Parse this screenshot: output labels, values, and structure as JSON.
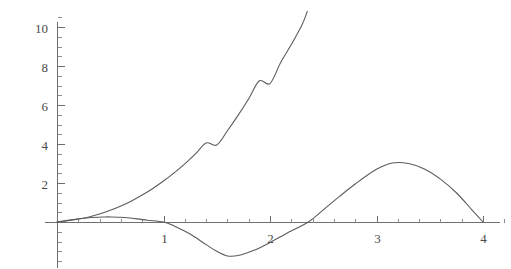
{
  "chart_data": {
    "type": "line",
    "title": "",
    "subtitle": "",
    "xlabel": "",
    "ylabel": "",
    "xlim": [
      -0.12,
      4.26
    ],
    "ylim": [
      -2.3,
      10.9
    ],
    "grid": false,
    "legend": "none",
    "background_color": "#ffffff",
    "axis_color": "#6f6f6f",
    "curve_color": "#5c5c5c",
    "x_ticks_major": [
      1,
      2,
      3,
      4
    ],
    "x_tick_labels": [
      "1",
      "2",
      "3",
      "4"
    ],
    "x_ticks_minor": [
      0.2,
      0.4,
      0.6,
      0.8,
      1.2,
      1.4,
      1.6,
      1.8,
      2.2,
      2.4,
      2.6,
      2.8,
      3.2,
      3.4,
      3.6,
      3.8,
      4.2
    ],
    "y_ticks_major": [
      2,
      4,
      6,
      8,
      10
    ],
    "y_tick_labels": [
      "2",
      "4",
      "6",
      "8",
      "10"
    ],
    "y_ticks_minor": [
      -2,
      -1.5,
      -1,
      -0.5,
      0.5,
      1,
      1.5,
      2.5,
      3,
      3.5,
      4.5,
      5,
      5.5,
      6.5,
      7,
      7.5,
      8.5,
      9,
      9.5,
      10.5
    ],
    "series": [
      {
        "name": "rising-exponential-curve",
        "description": "monotonically increasing convex curve from origin leaving the top of the frame near x = 2.35",
        "x": [
          0.0,
          0.1,
          0.2,
          0.3,
          0.4,
          0.5,
          0.6,
          0.7,
          0.8,
          0.9,
          1.0,
          1.1,
          1.2,
          1.3,
          1.4,
          1.5,
          1.6,
          1.7,
          1.8,
          1.9,
          2.0,
          2.1,
          2.2,
          2.3,
          2.35
        ],
        "y": [
          0.0,
          0.06,
          0.15,
          0.26,
          0.41,
          0.6,
          0.82,
          1.08,
          1.38,
          1.72,
          2.1,
          2.52,
          2.98,
          3.49,
          4.05,
          3.95,
          4.68,
          5.47,
          6.32,
          7.24,
          7.1,
          8.18,
          9.1,
          10.1,
          10.8
        ]
      },
      {
        "name": "oscillating-curve",
        "description": "low amplitude bump near x = 0.5, trough near x = 1.6, crest near x = 3.15, returning to zero at x = 4",
        "x": [
          0.0,
          0.15,
          0.3,
          0.45,
          0.5,
          0.6,
          0.75,
          0.85,
          1.0,
          1.1,
          1.25,
          1.4,
          1.5,
          1.6,
          1.7,
          1.85,
          2.0,
          2.15,
          2.36,
          2.5,
          2.65,
          2.8,
          3.0,
          3.15,
          3.3,
          3.45,
          3.6,
          3.75,
          3.9,
          4.0
        ],
        "y": [
          0.0,
          0.12,
          0.22,
          0.26,
          0.26,
          0.24,
          0.16,
          0.09,
          0.0,
          -0.2,
          -0.62,
          -1.16,
          -1.5,
          -1.74,
          -1.72,
          -1.45,
          -1.05,
          -0.6,
          0.0,
          0.62,
          1.3,
          1.95,
          2.7,
          3.03,
          3.0,
          2.72,
          2.2,
          1.5,
          0.6,
          0.0
        ]
      }
    ],
    "annotations": {
      "first_curve_peak_value": 3.03,
      "first_curve_trough_value": -1.74,
      "small_bump_peak_value": 0.26
    }
  },
  "axes": {
    "origin_px": {
      "x": 57,
      "y": 222
    },
    "x_unit_px": 106.5,
    "y_unit_px": 19.5
  }
}
